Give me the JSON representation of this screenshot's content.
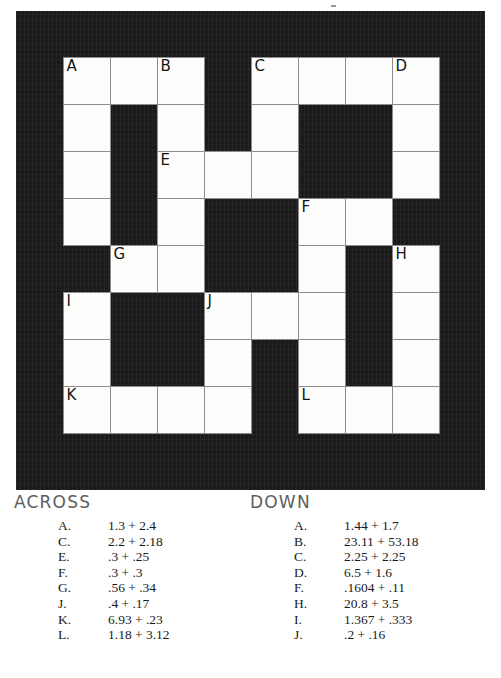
{
  "puzzle": {
    "rows": 8,
    "cols": 8,
    "block_color": "#1a1a1a",
    "cell_color": "#fdfdfb",
    "grid": [
      [
        "open",
        "open",
        "open",
        "blocked",
        "open",
        "open",
        "open",
        "open"
      ],
      [
        "open",
        "blocked",
        "open",
        "blocked",
        "open",
        "blocked",
        "blocked",
        "open"
      ],
      [
        "open",
        "blocked",
        "open",
        "open",
        "open",
        "blocked",
        "blocked",
        "open"
      ],
      [
        "open",
        "blocked",
        "open",
        "blocked",
        "blocked",
        "open",
        "open",
        "blocked"
      ],
      [
        "blocked",
        "open",
        "open",
        "blocked",
        "blocked",
        "open",
        "blocked",
        "open"
      ],
      [
        "open",
        "blocked",
        "blocked",
        "open",
        "open",
        "open",
        "blocked",
        "open"
      ],
      [
        "open",
        "blocked",
        "blocked",
        "open",
        "blocked",
        "open",
        "blocked",
        "open"
      ],
      [
        "open",
        "open",
        "open",
        "open",
        "blocked",
        "open",
        "open",
        "open"
      ]
    ],
    "labels": [
      [
        "A",
        "",
        "B",
        "",
        "C",
        "",
        "",
        "D"
      ],
      [
        "",
        "",
        "",
        "",
        "",
        "",
        "",
        ""
      ],
      [
        "",
        "",
        "E",
        "",
        "",
        "",
        "",
        ""
      ],
      [
        "",
        "",
        "",
        "",
        "",
        "F",
        "",
        ""
      ],
      [
        "",
        "G",
        "",
        "",
        "",
        "",
        "",
        "H"
      ],
      [
        "I",
        "",
        "",
        "J",
        "",
        "",
        "",
        ""
      ],
      [
        "",
        "",
        "",
        "",
        "",
        "",
        "",
        ""
      ],
      [
        "K",
        "",
        "",
        "",
        "",
        "L",
        "",
        ""
      ]
    ]
  },
  "clues": {
    "across": {
      "heading": "ACROSS",
      "items": [
        {
          "key": "A.",
          "text": "1.3 + 2.4"
        },
        {
          "key": "C.",
          "text": "2.2 + 2.18"
        },
        {
          "key": "E.",
          "text": ".3 + .25"
        },
        {
          "key": "F.",
          "text": ".3 + .3"
        },
        {
          "key": "G.",
          "text": ".56 + .34"
        },
        {
          "key": "J.",
          "text": ".4 + .17"
        },
        {
          "key": "K.",
          "text": "6.93 + .23"
        },
        {
          "key": "L.",
          "text": "1.18 + 3.12"
        }
      ]
    },
    "down": {
      "heading": "DOWN",
      "items": [
        {
          "key": "A.",
          "text": "1.44 + 1.7"
        },
        {
          "key": "B.",
          "text": "23.11 + 53.18"
        },
        {
          "key": "C.",
          "text": "2.25 + 2.25"
        },
        {
          "key": "D.",
          "text": "6.5 + 1.6"
        },
        {
          "key": "F.",
          "text": ".1604 + .11"
        },
        {
          "key": "H.",
          "text": "20.8 + 3.5"
        },
        {
          "key": "I.",
          "text": "1.367 + .333"
        },
        {
          "key": "J.",
          "text": ".2 + .16"
        }
      ]
    }
  }
}
